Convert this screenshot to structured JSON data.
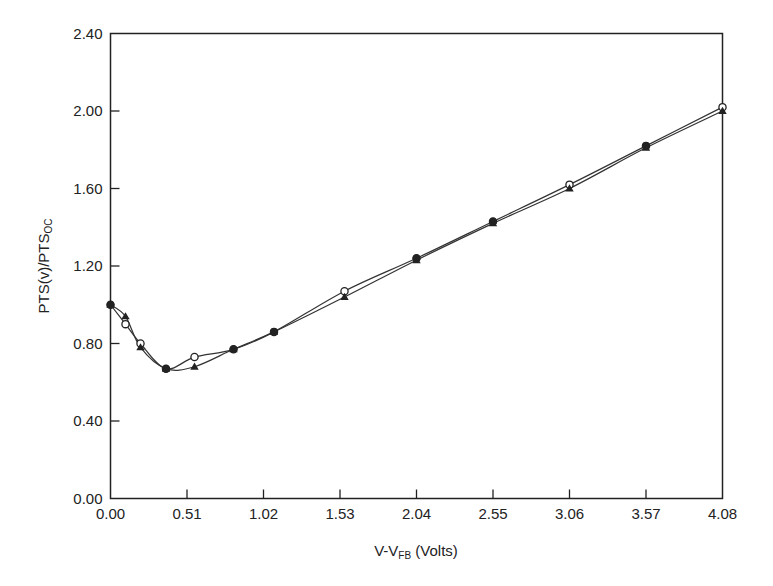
{
  "chart_data": {
    "type": "line",
    "title": "",
    "xlabel": "V-V",
    "xlabel_sub": "FB",
    "xlabel_suffix": " (Volts)",
    "ylabel": "PTS(v)/PTS",
    "ylabel_sub": "OC",
    "xlim": [
      0.0,
      4.08
    ],
    "ylim": [
      0.0,
      2.4
    ],
    "x_ticks": [
      "0.00",
      "0.51",
      "1.02",
      "1.53",
      "2.04",
      "2.55",
      "3.06",
      "3.57",
      "4.08"
    ],
    "y_ticks": [
      "0.00",
      "0.40",
      "0.80",
      "1.20",
      "1.60",
      "2.00",
      "2.40"
    ],
    "grid": false,
    "legend": null,
    "series": [
      {
        "name": "open-circle series",
        "marker": "circle-open",
        "x": [
          0.0,
          0.1,
          0.2,
          0.37,
          0.56,
          0.82,
          1.09,
          1.56,
          2.04,
          2.55,
          3.06,
          3.57,
          4.08
        ],
        "y": [
          1.0,
          0.9,
          0.8,
          0.67,
          0.73,
          0.77,
          0.86,
          1.07,
          1.24,
          1.43,
          1.62,
          1.82,
          2.02
        ]
      },
      {
        "name": "filled-triangle series",
        "marker": "triangle-filled",
        "x": [
          0.0,
          0.1,
          0.2,
          0.37,
          0.56,
          0.82,
          1.09,
          1.56,
          2.04,
          2.55,
          3.06,
          3.57,
          4.08
        ],
        "y": [
          1.0,
          0.94,
          0.78,
          0.67,
          0.68,
          0.77,
          0.86,
          1.04,
          1.23,
          1.42,
          1.6,
          1.81,
          2.0
        ]
      }
    ]
  }
}
